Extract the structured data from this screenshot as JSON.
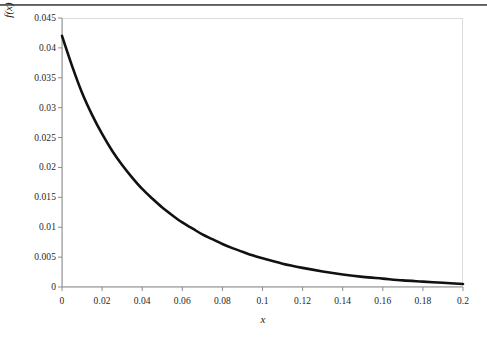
{
  "figure": {
    "background_color": "#ffffff",
    "page_rule_color": "#3c3c3c",
    "plot_border_color": "#dcdcdc",
    "axis_color": "#8c8c8c",
    "curve_color": "#111111"
  },
  "axes": {
    "x_title": "x",
    "y_title": "f(x)",
    "y_ticks": [
      "0",
      "0.005",
      "0.01",
      "0.015",
      "0.02",
      "0.025",
      "0.03",
      "0.035",
      "0.04",
      "0.045"
    ],
    "x_ticks": [
      "0",
      "0.02",
      "0.04",
      "0.06",
      "0.08",
      "0.1",
      "0.12",
      "0.14",
      "0.16",
      "0.18",
      "0.2"
    ]
  },
  "chart_data": {
    "type": "line",
    "title": "",
    "subtitle": "",
    "xlabel": "x",
    "ylabel": "f(x)",
    "xlim": [
      0,
      0.2
    ],
    "ylim": [
      0,
      0.045
    ],
    "xticks": [
      0,
      0.02,
      0.04,
      0.06,
      0.08,
      0.1,
      0.12,
      0.14,
      0.16,
      0.18,
      0.2
    ],
    "yticks": [
      0,
      0.005,
      0.01,
      0.015,
      0.02,
      0.025,
      0.03,
      0.035,
      0.04,
      0.045
    ],
    "grid": false,
    "legend": null,
    "annotations": [],
    "series": [
      {
        "name": "f(x)",
        "color": "#111111",
        "line_width": 2.6,
        "description": "monotonically decreasing exponential decay curve",
        "x": [
          0.0,
          0.005,
          0.01,
          0.015,
          0.02,
          0.025,
          0.03,
          0.035,
          0.04,
          0.045,
          0.05,
          0.055,
          0.06,
          0.065,
          0.07,
          0.075,
          0.08,
          0.085,
          0.09,
          0.095,
          0.1,
          0.11,
          0.12,
          0.13,
          0.14,
          0.15,
          0.16,
          0.17,
          0.18,
          0.19,
          0.2
        ],
        "values": [
          0.042,
          0.037,
          0.0325,
          0.0288,
          0.0256,
          0.0228,
          0.0204,
          0.0183,
          0.0164,
          0.0148,
          0.0133,
          0.012,
          0.0108,
          0.0098,
          0.0088,
          0.008,
          0.0072,
          0.0065,
          0.0059,
          0.0053,
          0.0048,
          0.0039,
          0.0032,
          0.0026,
          0.0021,
          0.0017,
          0.0014,
          0.0011,
          0.0009,
          0.0007,
          0.0005
        ]
      }
    ]
  }
}
